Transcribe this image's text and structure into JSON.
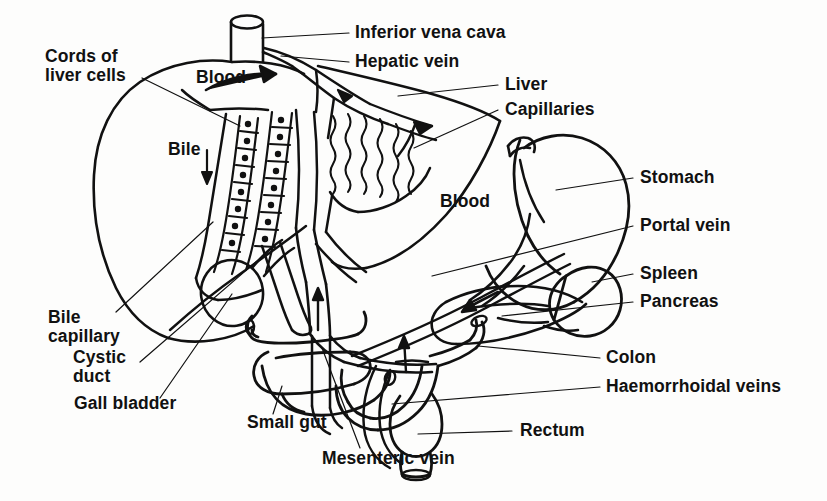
{
  "figure": {
    "ink_color": "#111111",
    "paper_color": "#fdfdfc",
    "width": 827,
    "height": 501
  },
  "labels": {
    "inferior_vena_cava": "Inferior vena cava",
    "hepatic_vein": "Hepatic vein",
    "liver": "Liver",
    "capillaries": "Capillaries",
    "stomach": "Stomach",
    "portal_vein": "Portal vein",
    "spleen": "Spleen",
    "pancreas": "Pancreas",
    "colon": "Colon",
    "haemorrhoidal_veins": "Haemorrhoidal veins",
    "rectum": "Rectum",
    "mesenteric_vein": "Mesenteric vein",
    "small_gut": "Small gut",
    "gall_bladder": "Gall bladder",
    "cystic_duct_l1": "Cystic",
    "cystic_duct_l2": "duct",
    "bile_capillary_l1": "Bile",
    "bile_capillary_l2": "capillary",
    "cords_of_liver_cells_l1": "Cords of",
    "cords_of_liver_cells_l2": "liver cells",
    "blood_left": "Blood",
    "blood_right": "Blood",
    "bile": "Bile"
  }
}
